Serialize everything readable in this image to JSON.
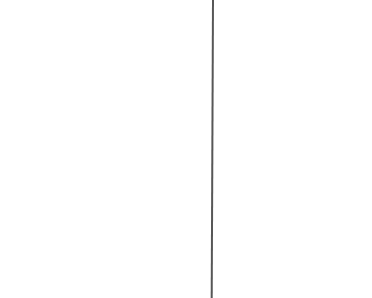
{
  "canvas": {
    "width": 372,
    "height": 298,
    "background": "#ffffff"
  },
  "vertical_line": {
    "x": 213,
    "color": "#3a3a3a",
    "thickness_px": 2
  }
}
